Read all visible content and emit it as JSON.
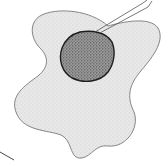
{
  "diagram": {
    "parts": [
      {
        "id": "cytoplasm",
        "fill": "#e6e6e6",
        "stroke": "#6a6a6a"
      },
      {
        "id": "nucleus",
        "fill": "#8a8a8a",
        "stroke": "#1e1e1e"
      }
    ],
    "leader_lines": [
      {
        "id": "pointer-nucleus",
        "from": [
          97,
          33
        ],
        "to": [
          150,
          3
        ]
      },
      {
        "id": "pointer-membrane",
        "from": [
          0,
          152
        ],
        "to": [
          14,
          159
        ]
      }
    ],
    "colors": {
      "background": "#ffffff",
      "cytoplasm": "#e6e6e6",
      "cytoplasm_stipple": "#b8b8b8",
      "nucleus": "#8a8a8a",
      "nucleus_stipple": "#2a2a2a",
      "outline": "#6a6a6a",
      "line": "#444444"
    }
  }
}
